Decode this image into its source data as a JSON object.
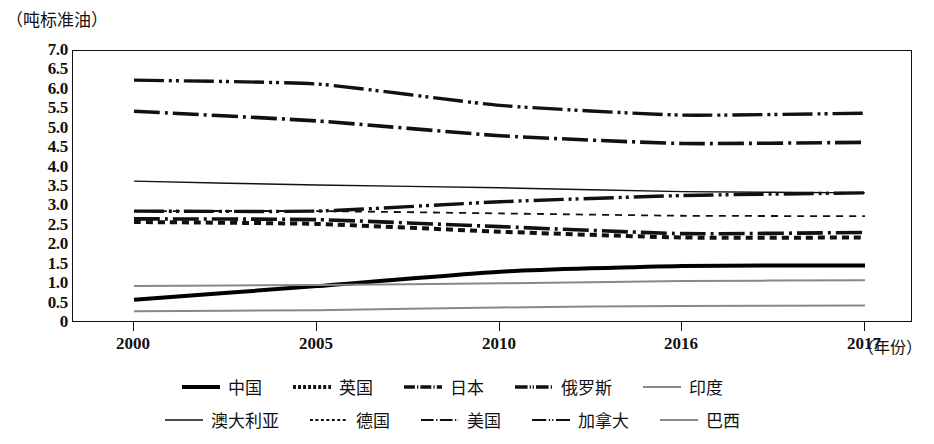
{
  "axes": {
    "y_unit_label": "（吨标准油）",
    "x_axis_title": "（年份）",
    "y_ticks": [
      "7.0",
      "6.5",
      "6.0",
      "5.5",
      "5.0",
      "4.5",
      "4.0",
      "3.5",
      "3.0",
      "2.5",
      "2.0",
      "1.5",
      "1.0",
      "0.5",
      "0"
    ],
    "x_ticks": [
      "2000",
      "2005",
      "2010",
      "2016",
      "2017"
    ]
  },
  "legend": {
    "row1": [
      {
        "label": "中国",
        "style": "solid-thick"
      },
      {
        "label": "英国",
        "style": "dotted-thick"
      },
      {
        "label": "日本",
        "style": "dashdot-thick"
      },
      {
        "label": "俄罗斯",
        "style": "dashdotdot-thick"
      },
      {
        "label": "印度",
        "style": "solid-gray"
      }
    ],
    "row2": [
      {
        "label": "澳大利亚",
        "style": "solid-thin"
      },
      {
        "label": "德国",
        "style": "dotted-thin"
      },
      {
        "label": "美国",
        "style": "dashdot-thin"
      },
      {
        "label": "加拿大",
        "style": "dashdotdot-thin"
      },
      {
        "label": "巴西",
        "style": "solid-gray"
      }
    ]
  },
  "chart_data": {
    "type": "line",
    "title": "",
    "xlabel": "（年份）",
    "ylabel": "（吨标准油）",
    "ylim": [
      0,
      7.0
    ],
    "ytick_step": 0.5,
    "grid": false,
    "legend_position": "bottom",
    "x": [
      2000,
      2005,
      2010,
      2016,
      2017
    ],
    "x_positions": [
      2000,
      2005,
      2010,
      2016,
      2017
    ],
    "series": [
      {
        "name": "加拿大",
        "style": "dashdotdot-thick",
        "color": "#111111",
        "values": [
          6.25,
          6.15,
          5.6,
          5.35,
          5.4
        ]
      },
      {
        "name": "美国",
        "style": "dashdot-thick",
        "color": "#111111",
        "values": [
          5.45,
          5.2,
          4.82,
          4.62,
          4.65
        ]
      },
      {
        "name": "澳大利亚",
        "style": "solid-thin",
        "color": "#111111",
        "values": [
          3.65,
          3.55,
          3.48,
          3.38,
          3.35
        ]
      },
      {
        "name": "中国",
        "style": "solid-thick",
        "color": "#000000",
        "values": [
          0.6,
          0.95,
          1.32,
          1.47,
          1.48
        ]
      },
      {
        "name": "俄罗斯",
        "style": "dashdotdot-thick",
        "color": "#111111",
        "values": [
          2.88,
          2.88,
          3.12,
          3.28,
          3.35
        ]
      },
      {
        "name": "德国",
        "style": "dotted-thin",
        "color": "#111111",
        "values": [
          2.88,
          2.88,
          2.82,
          2.76,
          2.75
        ]
      },
      {
        "name": "日本",
        "style": "dashdot-thick",
        "color": "#111111",
        "values": [
          2.68,
          2.66,
          2.48,
          2.3,
          2.33
        ]
      },
      {
        "name": "英国",
        "style": "dotted-thick",
        "color": "#111111",
        "values": [
          2.6,
          2.55,
          2.35,
          2.2,
          2.2
        ]
      },
      {
        "name": "印度",
        "style": "solid-gray",
        "color": "#888888",
        "values": [
          0.95,
          0.98,
          1.02,
          1.08,
          1.1
        ]
      },
      {
        "name": "巴西",
        "style": "solid-gray",
        "color": "#888888",
        "values": [
          0.3,
          0.33,
          0.4,
          0.44,
          0.45
        ]
      }
    ]
  }
}
